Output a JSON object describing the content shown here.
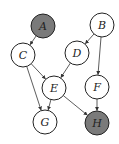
{
  "diagram": {
    "type": "directed-graph",
    "colors": {
      "observed_fill": "#7a7a7a",
      "unobserved_fill": "#ffffff",
      "stroke": "#222222",
      "edge": "#333333"
    },
    "nodes": [
      {
        "id": "A",
        "label": "A",
        "x": 43,
        "y": 26,
        "shaded": true
      },
      {
        "id": "B",
        "label": "B",
        "x": 102,
        "y": 25,
        "shaded": false
      },
      {
        "id": "C",
        "label": "C",
        "x": 23,
        "y": 55,
        "shaded": false
      },
      {
        "id": "D",
        "label": "D",
        "x": 77,
        "y": 53,
        "shaded": false
      },
      {
        "id": "E",
        "label": "E",
        "x": 54,
        "y": 88,
        "shaded": false
      },
      {
        "id": "F",
        "label": "F",
        "x": 97,
        "y": 87,
        "shaded": false
      },
      {
        "id": "G",
        "label": "G",
        "x": 45,
        "y": 122,
        "shaded": false
      },
      {
        "id": "H",
        "label": "H",
        "x": 97,
        "y": 123,
        "shaded": true
      }
    ],
    "edges": [
      {
        "from": "A",
        "to": "C"
      },
      {
        "from": "B",
        "to": "D"
      },
      {
        "from": "B",
        "to": "F"
      },
      {
        "from": "C",
        "to": "E"
      },
      {
        "from": "C",
        "to": "G"
      },
      {
        "from": "D",
        "to": "E"
      },
      {
        "from": "E",
        "to": "G"
      },
      {
        "from": "E",
        "to": "H"
      },
      {
        "from": "F",
        "to": "H"
      }
    ]
  }
}
